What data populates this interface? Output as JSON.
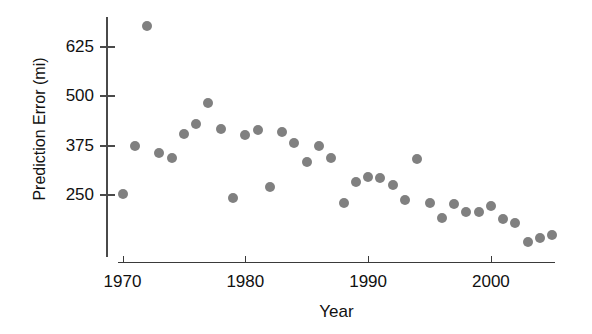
{
  "chart_data": {
    "type": "scatter",
    "title": "",
    "xlabel": "Year",
    "ylabel": "Prediction Error (mi)",
    "xlim": [
      1969,
      2006.5
    ],
    "ylim": [
      110,
      700
    ],
    "grid": false,
    "legend": null,
    "marker": {
      "shape": "circle",
      "color": "#808080",
      "size_px": 10
    },
    "axis_color": "#4a4a4a",
    "text_color": "#111111",
    "xticks": [
      1970,
      1980,
      1990,
      2000
    ],
    "xtick_labels": [
      "1970",
      "1980",
      "1990",
      "2000"
    ],
    "yticks": [
      250,
      375,
      500,
      625
    ],
    "ytick_labels": [
      "250",
      "375",
      "500",
      "625"
    ],
    "x": [
      1970,
      1971,
      1972,
      1973,
      1974,
      1975,
      1976,
      1977,
      1978,
      1979,
      1980,
      1981,
      1982,
      1983,
      1984,
      1985,
      1986,
      1987,
      1988,
      1989,
      1990,
      1991,
      1992,
      1993,
      1994,
      1995,
      1996,
      1997,
      1998,
      1999,
      2000,
      2001,
      2002,
      2003,
      2004,
      2005
    ],
    "y": [
      252,
      374,
      678,
      357,
      345,
      405,
      430,
      482,
      417,
      242,
      402,
      415,
      270,
      410,
      382,
      333,
      375,
      343,
      230,
      283,
      296,
      293,
      275,
      237,
      340,
      230,
      192,
      228,
      208,
      208,
      222,
      190,
      179,
      132,
      142,
      149
    ],
    "point_count": 36
  },
  "axes": {
    "y_title": "Prediction Error (mi)",
    "x_title": "Year"
  }
}
